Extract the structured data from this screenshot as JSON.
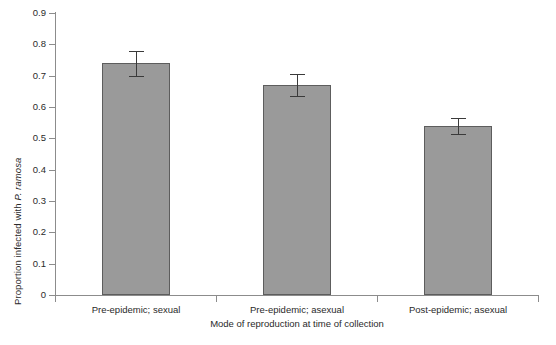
{
  "chart_data": {
    "type": "bar",
    "title": "",
    "subtitle": "",
    "xlabel": "Mode of reproduction at time of collection",
    "ylabel": "Proportion infected with P. ramosa",
    "ylabel_plain_prefix": "Proportion infected with ",
    "ylabel_italic_part": "P. ramosa",
    "categories": [
      "Pre-epidemic; sexual",
      "Pre-epidemic; asexual",
      "Post-epidemic; asexual"
    ],
    "values": [
      0.74,
      0.67,
      0.54
    ],
    "errors": [
      0.04,
      0.035,
      0.025
    ],
    "error_type": "standard error",
    "ylim": [
      0,
      0.9
    ],
    "ytick_values": [
      0,
      0.1,
      0.2,
      0.3,
      0.4,
      0.5,
      0.6,
      0.7,
      0.8,
      0.9
    ],
    "ytick_labels": [
      "0",
      "0.1",
      "0.2",
      "0.3",
      "0.4",
      "0.5",
      "0.6",
      "0.7",
      "0.8",
      "0.9"
    ],
    "grid": false,
    "legend": false,
    "legend_position": "none",
    "bar_fill_color": "#9a9a9a",
    "bar_edge_color": "#5d5d5d",
    "error_bar_color": "#3a3a3a",
    "axis_color": "#8c8c8c",
    "background_color": "#ffffff",
    "series": [
      {
        "name": "Proportion infected",
        "values": [
          0.74,
          0.67,
          0.54
        ],
        "errors": [
          0.04,
          0.035,
          0.025
        ]
      }
    ]
  }
}
